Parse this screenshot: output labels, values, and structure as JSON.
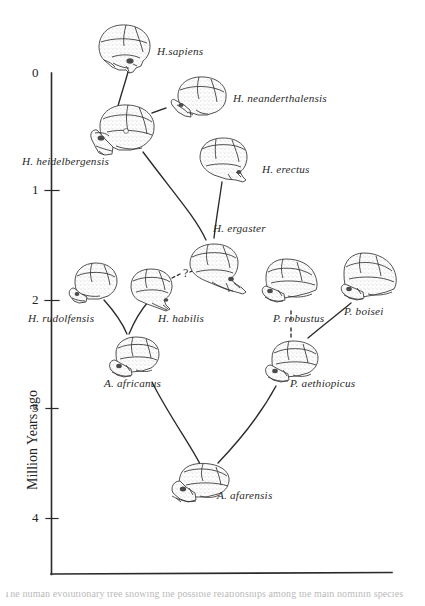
{
  "figure": {
    "type": "diagram",
    "background_color": "#ffffff",
    "ink_color": "#2a2a2a"
  },
  "axis": {
    "y_title": "Million Years ago",
    "y_ticks": [
      "0",
      "1",
      "2",
      "3",
      "4"
    ],
    "y_tick_values": [
      0,
      1,
      2,
      3,
      4
    ],
    "y_axis_line": {
      "x": 51,
      "y_top": 73,
      "y_bottom": 574
    },
    "x_axis_line": {
      "y": 574,
      "x_left": 51,
      "x_right": 392
    },
    "pixels_per_million_years": 111,
    "grid": "none",
    "x_ticks": []
  },
  "taxa": [
    {
      "id": "h-sapiens",
      "label": "H.sapiens",
      "label_x": 157,
      "label_y": 46,
      "age_ma": 0.05,
      "skull_x": 90,
      "skull_y": 26,
      "skull_w": 62,
      "skull_h": 50,
      "skull_kind": "sapiens"
    },
    {
      "id": "h-neanderthalensis",
      "label": "H. neanderthalensis",
      "label_x": 233,
      "label_y": 93,
      "age_ma": 0.35,
      "skull_x": 166,
      "skull_y": 74,
      "skull_w": 62,
      "skull_h": 46,
      "skull_kind": "neanderthal"
    },
    {
      "id": "h-heidelbergensis",
      "label": "H. heidelbergensis",
      "label_x": 22,
      "label_y": 156,
      "age_ma": 0.6,
      "skull_x": 90,
      "skull_y": 103,
      "skull_w": 68,
      "skull_h": 52,
      "skull_kind": "heidelberg"
    },
    {
      "id": "h-erectus",
      "label": "H. erectus",
      "label_x": 262,
      "label_y": 164,
      "age_ma": 0.9,
      "skull_x": 196,
      "skull_y": 136,
      "skull_w": 58,
      "skull_h": 44,
      "skull_kind": "erectus"
    },
    {
      "id": "h-ergaster",
      "label": "H. ergaster",
      "label_x": 213,
      "label_y": 223,
      "age_ma": 1.75,
      "skull_x": 186,
      "skull_y": 243,
      "skull_w": 62,
      "skull_h": 48,
      "skull_kind": "ergaster"
    },
    {
      "id": "h-rudolfensis",
      "label": "H. rudolfensis",
      "label_x": 28,
      "label_y": 313,
      "age_ma": 1.95,
      "skull_x": 70,
      "skull_y": 262,
      "skull_w": 52,
      "skull_h": 44,
      "skull_kind": "rudolfensis"
    },
    {
      "id": "h-habilis",
      "label": "H. habilis",
      "label_x": 158,
      "label_y": 313,
      "age_ma": 1.95,
      "skull_x": 128,
      "skull_y": 268,
      "skull_w": 50,
      "skull_h": 42,
      "skull_kind": "habilis"
    },
    {
      "id": "p-robustus",
      "label": "P. robustus",
      "label_x": 273,
      "label_y": 313,
      "age_ma": 1.9,
      "skull_x": 262,
      "skull_y": 258,
      "skull_w": 56,
      "skull_h": 46,
      "skull_kind": "robustus"
    },
    {
      "id": "p-boisei",
      "label": "P. boisei",
      "label_x": 344,
      "label_y": 307,
      "age_ma": 1.85,
      "skull_x": 340,
      "skull_y": 252,
      "skull_w": 56,
      "skull_h": 48,
      "skull_kind": "boisei"
    },
    {
      "id": "a-africanus",
      "label": "A. africanus",
      "label_x": 104,
      "label_y": 378,
      "age_ma": 2.6,
      "skull_x": 110,
      "skull_y": 336,
      "skull_w": 56,
      "skull_h": 42,
      "skull_kind": "africanus"
    },
    {
      "id": "p-aethiopicus",
      "label": "P. aethiopicus",
      "label_x": 290,
      "label_y": 378,
      "age_ma": 2.6,
      "skull_x": 264,
      "skull_y": 340,
      "skull_w": 58,
      "skull_h": 44,
      "skull_kind": "aethiopicus"
    },
    {
      "id": "a-afarensis",
      "label": "A. afarensis",
      "label_x": 217,
      "label_y": 490,
      "age_ma": 3.5,
      "skull_x": 166,
      "skull_y": 462,
      "skull_w": 62,
      "skull_h": 42,
      "skull_kind": "afarensis"
    }
  ],
  "annotations": [
    {
      "id": "question-mark-habilis-ergaster",
      "text": "?",
      "x": 183,
      "y": 272
    }
  ],
  "lineages": [
    {
      "from": "h-heidelbergensis",
      "to": "h-sapiens",
      "style": "solid"
    },
    {
      "from": "h-heidelbergensis",
      "to": "h-neanderthalensis",
      "style": "dashed"
    },
    {
      "from": "h-ergaster",
      "to": "h-heidelbergensis",
      "style": "solid"
    },
    {
      "from": "h-ergaster",
      "to": "h-erectus",
      "style": "solid"
    },
    {
      "from": "h-habilis",
      "to": "h-ergaster",
      "style": "dashed"
    },
    {
      "from": "a-africanus",
      "to": "h-rudolfensis",
      "style": "solid"
    },
    {
      "from": "a-africanus",
      "to": "h-habilis",
      "style": "solid"
    },
    {
      "from": "p-aethiopicus",
      "to": "p-robustus",
      "style": "dashed"
    },
    {
      "from": "p-aethiopicus",
      "to": "p-boisei",
      "style": "solid"
    },
    {
      "from": "a-afarensis",
      "to": "a-africanus",
      "style": "solid"
    },
    {
      "from": "a-afarensis",
      "to": "p-aethiopicus",
      "style": "solid"
    }
  ],
  "footer": {
    "cut_text": "The human evolutionary tree showing the possible relationships among the main hominin species"
  }
}
